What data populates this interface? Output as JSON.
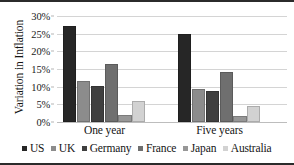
{
  "chart_data": {
    "type": "bar",
    "title": "",
    "xlabel": "",
    "ylabel": "Variation in Inflation",
    "categories": [
      "One year",
      "Five years"
    ],
    "ylim": [
      0,
      30
    ],
    "ytick_labels": [
      "0%",
      "5%",
      "10%",
      "15%",
      "20%",
      "25%",
      "30%"
    ],
    "ytick_values": [
      0,
      5,
      10,
      15,
      20,
      25,
      30
    ],
    "yaxis_unit": "%",
    "grid": true,
    "legend_position": "bottom",
    "series": [
      {
        "name": "US",
        "color": "#262626",
        "values": [
          27.3,
          25.0
        ]
      },
      {
        "name": "UK",
        "color": "#8c8c8c",
        "values": [
          11.5,
          9.4
        ]
      },
      {
        "name": "Germany",
        "color": "#3f3f3f",
        "values": [
          10.1,
          8.9
        ]
      },
      {
        "name": "France",
        "color": "#6f6f6f",
        "values": [
          16.4,
          14.1
        ]
      },
      {
        "name": "Japan",
        "color": "#979797",
        "values": [
          2.1,
          1.6
        ]
      },
      {
        "name": "Australia",
        "color": "#d2d2d2",
        "values": [
          5.9,
          4.5
        ]
      }
    ]
  },
  "axis": {
    "y_title": "Variation in Inflation"
  }
}
